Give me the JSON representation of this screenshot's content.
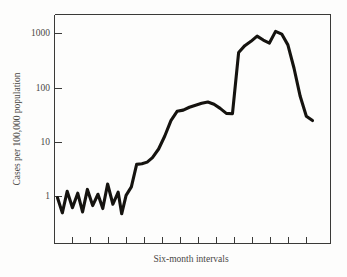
{
  "chart_data": {
    "type": "line",
    "title": "",
    "xlabel": "Six-month intervals",
    "ylabel": "Cases per 100,000 population",
    "yscale": "log",
    "ylim": [
      0.3,
      3000
    ],
    "ytick_labels": [
      "1000",
      "100",
      "10",
      "1"
    ],
    "ytick_values": [
      1000,
      100,
      10,
      1
    ],
    "xtick_labels": [
      "",
      "",
      "",
      "",
      "",
      "",
      "",
      "",
      "",
      "",
      "",
      "",
      "",
      ""
    ],
    "xtick_count": 14,
    "grid": false,
    "legend": null,
    "x": [
      0.0,
      0.55,
      1.1,
      1.7,
      2.3,
      2.85,
      3.4,
      4.0,
      4.6,
      5.15,
      5.7,
      6.3,
      6.9,
      7.3,
      7.8,
      8.4,
      9.0,
      9.6,
      10.2,
      10.8,
      11.5,
      12.2,
      12.9,
      13.6,
      14.3,
      15.0,
      15.7,
      16.4,
      17.1,
      17.8,
      18.5,
      19.2,
      19.9,
      20.6,
      21.3,
      22.0,
      22.7,
      23.4,
      24.1,
      24.8,
      25.5,
      26.2,
      26.9,
      27.6,
      28.3,
      29.0
    ],
    "values": [
      0.95,
      0.5,
      1.25,
      0.62,
      1.15,
      0.52,
      1.35,
      0.68,
      1.1,
      0.6,
      1.7,
      0.72,
      1.2,
      0.48,
      1.05,
      1.5,
      3.9,
      4.0,
      4.3,
      5.2,
      7.5,
      13.0,
      25.0,
      37.0,
      39.0,
      44.0,
      48.0,
      52.0,
      55.0,
      50.0,
      42.0,
      34.0,
      33.5,
      450.0,
      600.0,
      720.0,
      900.0,
      760.0,
      670.0,
      1100.0,
      980.0,
      620.0,
      230.0,
      70.0,
      30.0,
      25.0
    ],
    "series_color": "#15130f",
    "curve_note": "Epidemic-style log curve: low oscillation near 1, stepwise rise, plateau near 50, sharp jump to several hundred, double peak above 1000, then steep decline to about 25"
  },
  "axes": {
    "y_axis_label": "Cases per 100,000 population",
    "x_axis_label": "Six-month intervals",
    "y_tick_1000": "1000",
    "y_tick_100": "100",
    "y_tick_10": "10",
    "y_tick_1": "1"
  }
}
